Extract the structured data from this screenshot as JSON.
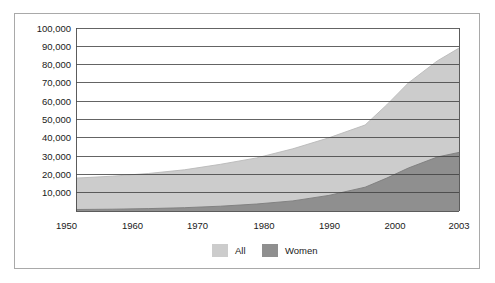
{
  "chart_data": {
    "type": "area",
    "title": "",
    "subtitle": "",
    "xlabel": "",
    "ylabel": "",
    "grid": true,
    "legend_position": "bottom-center",
    "xlim": [
      1950,
      2003
    ],
    "ylim": [
      0,
      100000
    ],
    "y_ticks": [
      0,
      10000,
      20000,
      30000,
      40000,
      50000,
      60000,
      70000,
      80000,
      90000,
      100000
    ],
    "y_tick_labels": [
      "",
      "10,000",
      "20,000",
      "30,000",
      "40,000",
      "50,000",
      "60,000",
      "70,000",
      "80,000",
      "90,000",
      "100,000"
    ],
    "x_ticks": [
      1950,
      1960,
      1970,
      1980,
      1990,
      2000,
      2003
    ],
    "x_tick_labels": [
      "1950",
      "1960",
      "1970",
      "1980",
      "1990",
      "2000",
      "2003"
    ],
    "colors": {
      "all": "#cccccc",
      "women": "#8f8f8f",
      "gridline": "#3d3d3d",
      "frame": "#a9a9a9"
    },
    "legend": [
      {
        "label": "All",
        "color": "#cccccc"
      },
      {
        "label": "Women",
        "color": "#8f8f8f"
      }
    ],
    "series": [
      {
        "name": "All",
        "color": "#cccccc",
        "x": [
          1950,
          1955,
          1960,
          1965,
          1970,
          1975,
          1980,
          1985,
          1990,
          1993,
          1996,
          2000,
          2003
        ],
        "values": [
          18000,
          19000,
          20500,
          22500,
          25500,
          29000,
          34000,
          40000,
          47000,
          58000,
          70000,
          82000,
          89000
        ]
      },
      {
        "name": "Women",
        "color": "#8f8f8f",
        "x": [
          1950,
          1955,
          1960,
          1965,
          1970,
          1975,
          1980,
          1985,
          1990,
          1993,
          1996,
          2000,
          2003
        ],
        "values": [
          800,
          1000,
          1300,
          1800,
          2600,
          3800,
          5500,
          8500,
          13000,
          18000,
          23500,
          29500,
          32000
        ]
      }
    ]
  },
  "axes": {
    "y_tick_labels": [
      "100,000",
      "90,000",
      "80,000",
      "70,000",
      "60,000",
      "50,000",
      "40,000",
      "30,000",
      "20,000",
      "10,000"
    ],
    "x_tick_labels": [
      "1950",
      "1960",
      "1970",
      "1980",
      "1990",
      "2000",
      "2003"
    ]
  },
  "legend": {
    "items": [
      {
        "label": "All",
        "color": "#cccccc"
      },
      {
        "label": "Women",
        "color": "#8f8f8f"
      }
    ]
  }
}
